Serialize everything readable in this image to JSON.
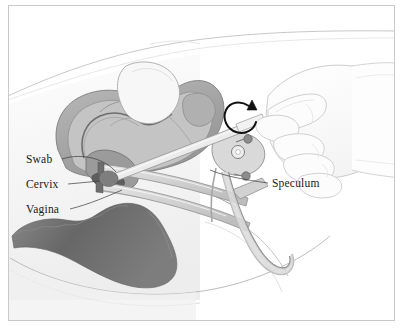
{
  "figure": {
    "frame_color": "#c9c9c9",
    "background": "#ffffff"
  },
  "labels": [
    {
      "id": "swab",
      "text": "Swab",
      "x": 26,
      "y": 163,
      "icon": "text-label"
    },
    {
      "id": "cervix",
      "text": "Cervix",
      "x": 26,
      "y": 188,
      "icon": "text-label"
    },
    {
      "id": "vagina",
      "text": "Vagina",
      "x": 26,
      "y": 213,
      "icon": "text-label"
    },
    {
      "id": "speculum",
      "text": "Speculum",
      "x": 272,
      "y": 187,
      "icon": "text-label"
    }
  ],
  "annotations": {
    "rotation_arrow": {
      "name": "swab-rotation-arrow",
      "description": "curved circular arrow indicating rotation of the swab",
      "center_x": 240,
      "center_y": 116,
      "color": "#111111"
    }
  },
  "anatomy": [
    {
      "id": "uterus",
      "name": "uterus",
      "tone": "#9a9a9a"
    },
    {
      "id": "bladder",
      "name": "bladder",
      "tone": "#f2f2f2"
    },
    {
      "id": "cervix-body",
      "name": "cervix",
      "tone": "#8f8f8f"
    },
    {
      "id": "vaginal-canal",
      "name": "vaginal-canal",
      "tone": "#b5b5b5"
    },
    {
      "id": "rectum",
      "name": "rectum",
      "tone": "#6f6f6f"
    },
    {
      "id": "body-outline",
      "name": "body-outline",
      "tone": "#d8d8d8"
    }
  ],
  "instruments": [
    {
      "id": "speculum-instrument",
      "name": "speculum",
      "tone": "#cfcfcf"
    },
    {
      "id": "swab-instrument",
      "name": "swab",
      "tone": "#e2e2e2"
    },
    {
      "id": "hand",
      "name": "clinician-hand",
      "tone": "#fbfbfb"
    }
  ],
  "palette": {
    "line_dark": "#4a4a4a",
    "line_mid": "#8c8c8c",
    "line_light": "#cccccc",
    "fill_dark": "#6f6f6f",
    "fill_mid": "#a8a8a8",
    "fill_light": "#d9d9d9",
    "fill_pale": "#efefef",
    "white": "#ffffff"
  }
}
